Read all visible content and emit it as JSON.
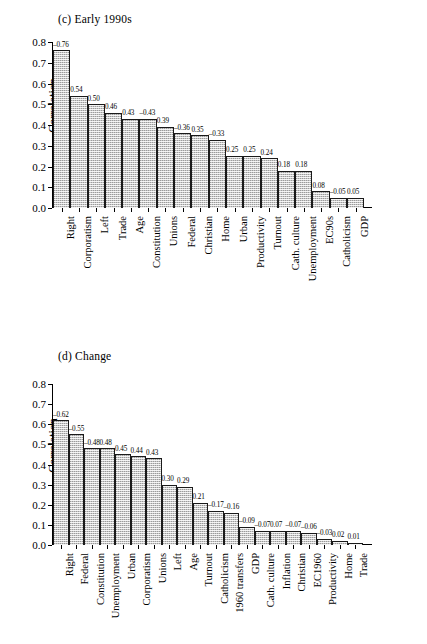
{
  "chart_data": [
    {
      "type": "bar",
      "title": "(c) Early 1990s",
      "xlabel": "",
      "ylabel": "Correlation",
      "ylim": [
        0.0,
        0.8
      ],
      "yticks": [
        "0.0",
        "0.1",
        "0.2",
        "0.3",
        "0.4",
        "0.5",
        "0.6",
        "0.7",
        "0.8"
      ],
      "grid": false,
      "legend": "none",
      "categories": [
        "Right",
        "Corporatism",
        "Left",
        "Trade",
        "Age",
        "Constitution",
        "Unions",
        "Federal",
        "Christian",
        "Home",
        "Urban",
        "Productivity",
        "Turnout",
        "Cath. culture",
        "Unemployment",
        "EC90s",
        "Catholicism",
        "GDP"
      ],
      "values": [
        0.76,
        0.54,
        0.5,
        0.46,
        0.43,
        0.43,
        0.39,
        0.36,
        0.35,
        0.33,
        0.25,
        0.25,
        0.24,
        0.18,
        0.18,
        0.08,
        0.05,
        0.05
      ],
      "data_labels": [
        "–0.76",
        "0.54",
        "0.50",
        "0.46",
        "0.43",
        "–0.43",
        "0.39",
        "–0.36",
        "0.35",
        "–0.33",
        "0.25",
        "0.25",
        "0.24",
        "0.18",
        "0.18",
        "0.08",
        "–0.05",
        "0.05"
      ]
    },
    {
      "type": "bar",
      "title": "(d) Change",
      "xlabel": "",
      "ylabel": "Correlation",
      "ylim": [
        0.0,
        0.8
      ],
      "yticks": [
        "0.0",
        "0.1",
        "0.2",
        "0.3",
        "0.4",
        "0.5",
        "0.6",
        "0.7",
        "0.8"
      ],
      "grid": false,
      "legend": "none",
      "categories": [
        "Right",
        "Federal",
        "Constitution",
        "Unemployment",
        "Urban",
        "Corporatism",
        "Unions",
        "Left",
        "Age",
        "Turnout",
        "Catholicism",
        "1960 transfers",
        "GDP",
        "Cath. culture",
        "Inflation",
        "Christian",
        "EC1960",
        "Productivity",
        "Home",
        "Trade"
      ],
      "values": [
        0.62,
        0.55,
        0.48,
        0.48,
        0.45,
        0.44,
        0.43,
        0.3,
        0.29,
        0.21,
        0.17,
        0.16,
        0.09,
        0.07,
        0.07,
        0.07,
        0.06,
        0.03,
        0.02,
        0.01
      ],
      "data_labels": [
        "–0.62",
        "–0.55",
        "–0.48",
        "0.48",
        "0.45",
        "0.44",
        "0.43",
        "0.30",
        "0.29",
        "0.21",
        "–0.17",
        "–0.16",
        "–0.09",
        "–0.07",
        "0.07",
        "–0.07",
        "–0.06",
        "–0.03",
        "0.02",
        "0.01"
      ]
    }
  ]
}
